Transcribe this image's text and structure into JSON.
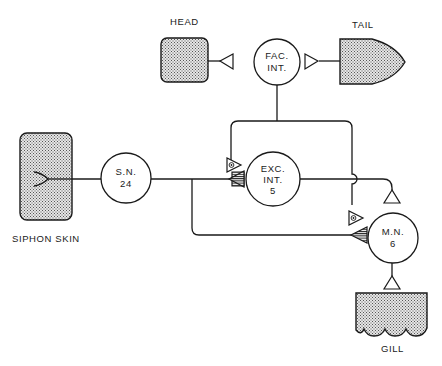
{
  "diagram": {
    "type": "neural-circuit",
    "organs": {
      "head": {
        "label": "HEAD"
      },
      "tail": {
        "label": "TAIL"
      },
      "siphon_skin": {
        "label": "SIPHON SKIN"
      },
      "gill": {
        "label": "GILL"
      }
    },
    "neurons": {
      "fac_int": {
        "line1": "FAC.",
        "line2": "INT."
      },
      "sensory": {
        "line1": "S.N.",
        "line2": "24"
      },
      "exc_int": {
        "line1": "EXC.",
        "line2": "INT.",
        "line3": "5"
      },
      "motor": {
        "line1": "M.N.",
        "line2": "6"
      }
    },
    "synapse_types": {
      "open_triangle": "excitatory-output",
      "dotted_triangle": "facilitatory",
      "hatched_triangle": "sensory-input"
    },
    "colors": {
      "ink": "#1a1a1a",
      "stipple": "#8a8a8a",
      "background": "#ffffff"
    }
  }
}
